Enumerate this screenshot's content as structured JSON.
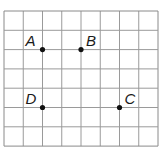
{
  "grid": {
    "columns": 8,
    "rows": 7,
    "left": 4,
    "top": 11,
    "cell_w": 19.25,
    "cell_h": 19.3,
    "line_color": "#9a9a9a",
    "border_color": "#8a8a8a"
  },
  "points": [
    {
      "label": "A",
      "col": 2,
      "row": 2,
      "label_dx": -17,
      "label_dy": -4
    },
    {
      "label": "B",
      "col": 4,
      "row": 2,
      "label_dx": 5,
      "label_dy": -4
    },
    {
      "label": "C",
      "col": 6,
      "row": 5,
      "label_dx": 5,
      "label_dy": -4
    },
    {
      "label": "D",
      "col": 2,
      "row": 5,
      "label_dx": -17,
      "label_dy": -4
    }
  ],
  "point_color": "#111111"
}
